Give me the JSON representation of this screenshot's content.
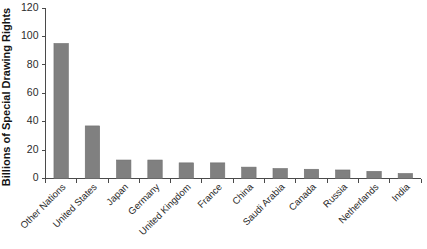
{
  "chart_data": {
    "type": "bar",
    "title": "",
    "subtitle": "",
    "xlabel": "",
    "ylabel": "Billions of Special Drawing Rights",
    "ylim": [
      0,
      120
    ],
    "yticks": [
      0,
      20,
      40,
      60,
      80,
      100,
      120
    ],
    "ytick_labels": [
      "0",
      "20",
      "40",
      "60",
      "80",
      "100",
      "120"
    ],
    "grid": false,
    "legend": false,
    "legend_position": "none",
    "bar_color": "#808080",
    "bar_edge_color": "#6e6e6e",
    "axis_color": "#4a4a4a",
    "background_color": "#ffffff",
    "xtick_label_rotation": 45,
    "categories": [
      "Other Nations",
      "United States",
      "Japan",
      "Germany",
      "United Kingdom",
      "France",
      "China",
      "Saudi Arabia",
      "Canada",
      "Russia",
      "Netherlands",
      "India"
    ],
    "values": [
      95,
      37,
      13,
      13,
      11,
      11,
      8,
      7,
      6.5,
      6,
      5,
      3.5
    ]
  }
}
